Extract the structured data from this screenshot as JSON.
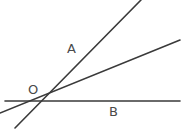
{
  "figure": {
    "background_color": "#ffffff",
    "stroke_color": "#3a3a3a",
    "label_color": "#4a4a4a",
    "width": 184,
    "height": 134
  },
  "labels": {
    "vertex": "O",
    "ray_upper": "A",
    "ray_horizontal": "B"
  },
  "caption": {
    "text": ""
  },
  "chart_data": {
    "type": "line",
    "xlabel": "",
    "ylabel": "",
    "xlim": [
      0,
      184
    ],
    "ylim": [
      134,
      0
    ],
    "grid": false,
    "legend": "none",
    "vertex": {
      "name": "O",
      "x": 41,
      "y": 102
    },
    "series": [
      {
        "name": "horizontal-line-B",
        "label": "B",
        "x": [
          5,
          180
        ],
        "y": [
          101,
          101
        ]
      },
      {
        "name": "steep-ray-A",
        "label": "A",
        "x": [
          15,
          141
        ],
        "y": [
          128,
          0
        ]
      },
      {
        "name": "shallow-ray",
        "label": "",
        "x": [
          0,
          180
        ],
        "y": [
          113,
          40
        ]
      }
    ],
    "annotations": [
      {
        "text": "O",
        "x": 32,
        "y": 90
      },
      {
        "text": "A",
        "x": 72,
        "y": 49
      },
      {
        "text": "B",
        "x": 114,
        "y": 112
      }
    ]
  }
}
